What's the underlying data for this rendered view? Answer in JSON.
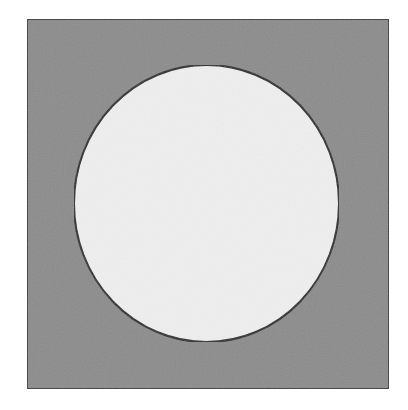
{
  "figure": {
    "background": "#ffffff",
    "square": {
      "x": 27,
      "y": 19,
      "width": 362,
      "height": 370,
      "fill": "#8c8c8c",
      "stroke": "#3a3a3a",
      "stroke_width": 2
    },
    "circle": {
      "cx": 206.5,
      "cy": 203.5,
      "rx": 132.5,
      "ry": 138.5,
      "fill": "#efefef",
      "stroke": "#2a2a2a",
      "stroke_width": 2
    }
  }
}
